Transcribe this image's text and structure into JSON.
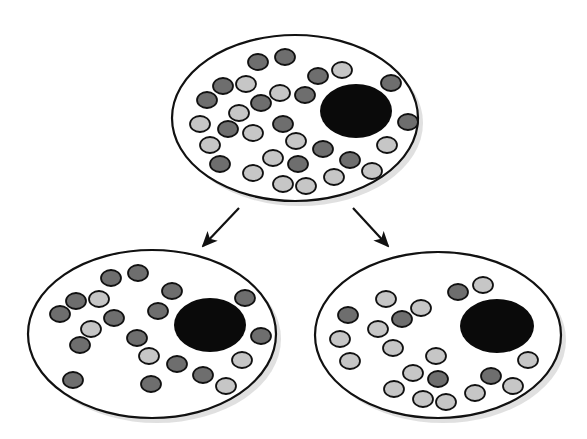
{
  "diagram": {
    "colors": {
      "background": "#ffffff",
      "cell_fill": "#ffffff",
      "outline": "#111111",
      "nucleus": "#0a0a0a",
      "dark_granule": "#6e6e6e",
      "light_granule": "#c6c6c6",
      "shadow": "#d8d8d8",
      "arrow": "#111111"
    },
    "granule_size": {
      "rx": 10,
      "ry": 8
    },
    "cells": [
      {
        "id": "parent",
        "ellipse": {
          "cx": 295,
          "cy": 118,
          "rx": 123,
          "ry": 83
        },
        "nucleus": {
          "cx": 356,
          "cy": 111,
          "rx": 36,
          "ry": 27
        },
        "granules": [
          {
            "x": 258,
            "y": 62,
            "t": "dark"
          },
          {
            "x": 285,
            "y": 57,
            "t": "dark"
          },
          {
            "x": 318,
            "y": 76,
            "t": "dark"
          },
          {
            "x": 342,
            "y": 70,
            "t": "light"
          },
          {
            "x": 223,
            "y": 86,
            "t": "dark"
          },
          {
            "x": 246,
            "y": 84,
            "t": "light"
          },
          {
            "x": 280,
            "y": 93,
            "t": "light"
          },
          {
            "x": 305,
            "y": 95,
            "t": "dark"
          },
          {
            "x": 391,
            "y": 83,
            "t": "dark"
          },
          {
            "x": 207,
            "y": 100,
            "t": "dark"
          },
          {
            "x": 261,
            "y": 103,
            "t": "dark"
          },
          {
            "x": 239,
            "y": 113,
            "t": "light"
          },
          {
            "x": 200,
            "y": 124,
            "t": "light"
          },
          {
            "x": 228,
            "y": 129,
            "t": "dark"
          },
          {
            "x": 253,
            "y": 133,
            "t": "light"
          },
          {
            "x": 283,
            "y": 124,
            "t": "dark"
          },
          {
            "x": 408,
            "y": 122,
            "t": "dark"
          },
          {
            "x": 210,
            "y": 145,
            "t": "light"
          },
          {
            "x": 296,
            "y": 141,
            "t": "light"
          },
          {
            "x": 323,
            "y": 149,
            "t": "dark"
          },
          {
            "x": 387,
            "y": 145,
            "t": "light"
          },
          {
            "x": 220,
            "y": 164,
            "t": "dark"
          },
          {
            "x": 273,
            "y": 158,
            "t": "light"
          },
          {
            "x": 298,
            "y": 164,
            "t": "dark"
          },
          {
            "x": 350,
            "y": 160,
            "t": "dark"
          },
          {
            "x": 253,
            "y": 173,
            "t": "light"
          },
          {
            "x": 283,
            "y": 184,
            "t": "light"
          },
          {
            "x": 306,
            "y": 186,
            "t": "light"
          },
          {
            "x": 334,
            "y": 177,
            "t": "light"
          },
          {
            "x": 372,
            "y": 171,
            "t": "light"
          }
        ]
      },
      {
        "id": "daughter-dark",
        "ellipse": {
          "cx": 152,
          "cy": 334,
          "rx": 124,
          "ry": 84
        },
        "nucleus": {
          "cx": 210,
          "cy": 325,
          "rx": 36,
          "ry": 27
        },
        "granules": [
          {
            "x": 111,
            "y": 278,
            "t": "dark"
          },
          {
            "x": 138,
            "y": 273,
            "t": "dark"
          },
          {
            "x": 172,
            "y": 291,
            "t": "dark"
          },
          {
            "x": 245,
            "y": 298,
            "t": "dark"
          },
          {
            "x": 76,
            "y": 301,
            "t": "dark"
          },
          {
            "x": 99,
            "y": 299,
            "t": "light"
          },
          {
            "x": 60,
            "y": 314,
            "t": "dark"
          },
          {
            "x": 114,
            "y": 318,
            "t": "dark"
          },
          {
            "x": 158,
            "y": 311,
            "t": "dark"
          },
          {
            "x": 91,
            "y": 329,
            "t": "light"
          },
          {
            "x": 80,
            "y": 345,
            "t": "dark"
          },
          {
            "x": 137,
            "y": 338,
            "t": "dark"
          },
          {
            "x": 261,
            "y": 336,
            "t": "dark"
          },
          {
            "x": 149,
            "y": 356,
            "t": "light"
          },
          {
            "x": 177,
            "y": 364,
            "t": "dark"
          },
          {
            "x": 242,
            "y": 360,
            "t": "light"
          },
          {
            "x": 73,
            "y": 380,
            "t": "dark"
          },
          {
            "x": 151,
            "y": 384,
            "t": "dark"
          },
          {
            "x": 203,
            "y": 375,
            "t": "dark"
          },
          {
            "x": 226,
            "y": 386,
            "t": "light"
          }
        ]
      },
      {
        "id": "daughter-light",
        "ellipse": {
          "cx": 438,
          "cy": 335,
          "rx": 123,
          "ry": 83
        },
        "nucleus": {
          "cx": 497,
          "cy": 326,
          "rx": 37,
          "ry": 27
        },
        "granules": [
          {
            "x": 458,
            "y": 292,
            "t": "dark"
          },
          {
            "x": 483,
            "y": 285,
            "t": "light"
          },
          {
            "x": 386,
            "y": 299,
            "t": "light"
          },
          {
            "x": 421,
            "y": 308,
            "t": "light"
          },
          {
            "x": 348,
            "y": 315,
            "t": "dark"
          },
          {
            "x": 402,
            "y": 319,
            "t": "dark"
          },
          {
            "x": 378,
            "y": 329,
            "t": "light"
          },
          {
            "x": 340,
            "y": 339,
            "t": "light"
          },
          {
            "x": 393,
            "y": 348,
            "t": "light"
          },
          {
            "x": 350,
            "y": 361,
            "t": "light"
          },
          {
            "x": 436,
            "y": 356,
            "t": "light"
          },
          {
            "x": 528,
            "y": 360,
            "t": "light"
          },
          {
            "x": 413,
            "y": 373,
            "t": "light"
          },
          {
            "x": 438,
            "y": 379,
            "t": "dark"
          },
          {
            "x": 491,
            "y": 376,
            "t": "dark"
          },
          {
            "x": 394,
            "y": 389,
            "t": "light"
          },
          {
            "x": 475,
            "y": 393,
            "t": "light"
          },
          {
            "x": 513,
            "y": 386,
            "t": "light"
          },
          {
            "x": 423,
            "y": 399,
            "t": "light"
          },
          {
            "x": 446,
            "y": 402,
            "t": "light"
          }
        ]
      }
    ],
    "arrows": [
      {
        "id": "arrow-left",
        "x1": 239,
        "y1": 208,
        "x2": 203,
        "y2": 246
      },
      {
        "id": "arrow-right",
        "x1": 353,
        "y1": 208,
        "x2": 388,
        "y2": 246
      }
    ]
  }
}
